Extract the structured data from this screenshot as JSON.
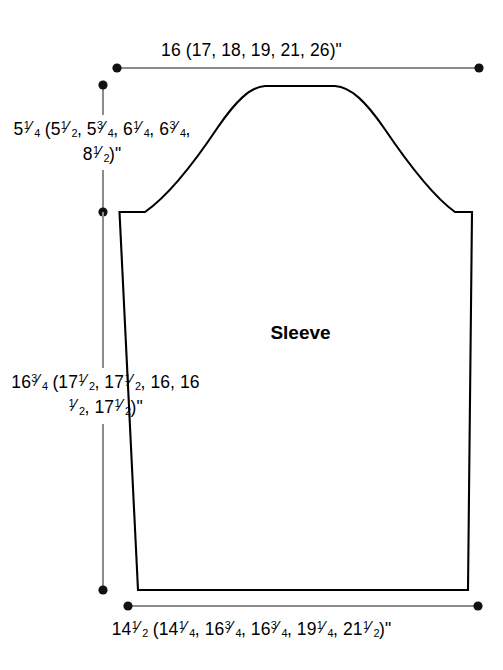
{
  "diagram": {
    "title": "Sleeve",
    "piece_label": "Sleeve",
    "units": "inches",
    "line_color": "#000000",
    "dimension_line_color": "#8c8c8c",
    "background_color": "#ffffff",
    "labels": {
      "top_width": "16 (17, 18, 19, 21, 26)\"",
      "cap_height": "5¼ (5½, 5¾, 6¼, 6¾, 8½)\"",
      "sleeve_length": "16¾ (17½, 17½, 16, 16½, 17½)\"",
      "bottom_width": "14½ (14¼, 16¾, 16¾, 19¼, 21½)\""
    },
    "measurements": {
      "upper_arm_width": {
        "label": "16 (17, 18, 19, 21, 26)\"",
        "base": "16",
        "alternates": [
          "17",
          "18",
          "19",
          "21",
          "26"
        ],
        "unit": "\""
      },
      "cap_height": {
        "label": "5¼ (5½, 5¾, 6¼, 6¾, 8½)\"",
        "base": "5¼",
        "alternates": [
          "5½",
          "5¾",
          "6¼",
          "6¾",
          "8½"
        ],
        "unit": "\""
      },
      "length_to_underarm": {
        "label": "16¾ (17½, 17½, 16, 16½, 17½)\"",
        "base": "16¾",
        "alternates": [
          "17½",
          "17½",
          "16",
          "16½",
          "17½"
        ],
        "unit": "\""
      },
      "lower_edge_width": {
        "label": "14½ (14¼, 16¾, 16¾, 19¼, 21½)\"",
        "base": "14½",
        "alternates": [
          "14¼",
          "16¾",
          "16¾",
          "19¼",
          "21½"
        ],
        "unit": "\""
      }
    }
  }
}
